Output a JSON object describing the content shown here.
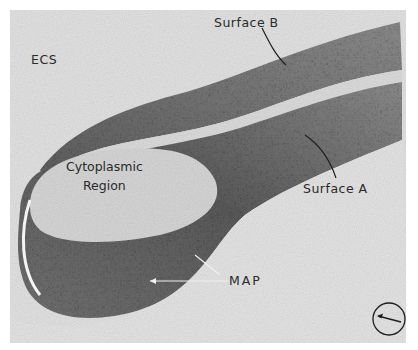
{
  "figure": {
    "type": "freeze-fracture electron micrograph",
    "labels": {
      "ecs": "ECS",
      "surface_b": "Surface B",
      "cytoplasmic_line1": "Cytoplasmic",
      "cytoplasmic_line2": "Region",
      "surface_a": "Surface A",
      "map": "MAP"
    },
    "shadow_direction_icon": "circled-arrow-icon",
    "colors": {
      "background": "#e4e4e4",
      "membrane_dark": "#6a6a6a",
      "membrane_mid": "#8c8c8c",
      "cytoplasm": "#d8d8d8",
      "text": "#2a2a2a"
    }
  }
}
